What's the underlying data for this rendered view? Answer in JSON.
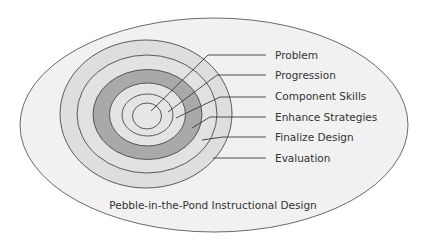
{
  "diagram": {
    "title": "Pebble-in-the-Pond Instructional Design",
    "colors": {
      "background": "#ffffff",
      "outer_ellipse": "#f1f1f1",
      "outer_rings": "#dedede",
      "dark_ring": "#a9a9a9",
      "inner_area": "#e4e4e4",
      "stroke": "#4a4a4a",
      "text": "#333333"
    },
    "layers": [
      {
        "label": "Problem",
        "order": 1
      },
      {
        "label": "Progression",
        "order": 2
      },
      {
        "label": "Component Skills",
        "order": 3
      },
      {
        "label": "Enhance Strategies",
        "order": 4
      },
      {
        "label": "Finalize Design",
        "order": 5
      },
      {
        "label": "Evaluation",
        "order": 6
      }
    ]
  }
}
